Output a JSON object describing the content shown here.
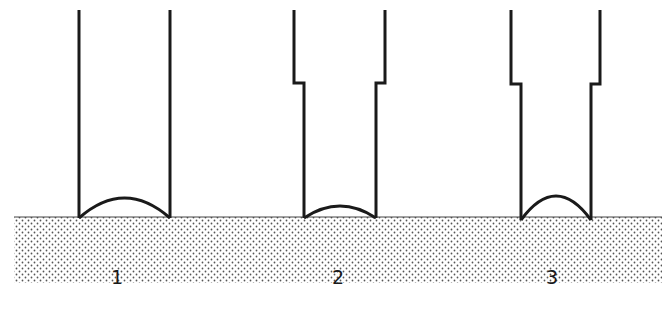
{
  "diagram": {
    "title": "",
    "colors": {
      "stroke": "#1a1a1a",
      "background": "#ffffff",
      "stipple_dot": "#555555"
    },
    "surface": {
      "x": 14,
      "y": 217,
      "width": 648,
      "height": 66,
      "pattern": "stippled"
    },
    "tubes": [
      {
        "id": 1,
        "label": "1",
        "label_x": 117,
        "shape": "straight",
        "outer_left": 79,
        "outer_right": 170,
        "top": 10,
        "bottom": 218,
        "meniscus_peak_y": 198
      },
      {
        "id": 2,
        "label": "2",
        "label_x": 338,
        "shape": "stepped",
        "outer_left": 294,
        "outer_right": 385,
        "step_y": 83,
        "inner_left": 304,
        "inner_right": 376,
        "top": 10,
        "bottom": 218,
        "meniscus_peak_y": 206
      },
      {
        "id": 3,
        "label": "3",
        "label_x": 552,
        "shape": "stepped",
        "outer_left": 511,
        "outer_right": 600,
        "step_y": 84,
        "inner_left": 521,
        "inner_right": 591,
        "top": 10,
        "bottom": 220,
        "meniscus_peak_y": 196
      }
    ]
  }
}
